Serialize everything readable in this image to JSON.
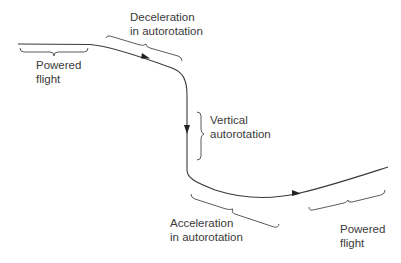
{
  "diagram": {
    "type": "flight-path",
    "colors": {
      "line": "#3a3a3a",
      "text": "#3a3a3a",
      "background": "#ffffff"
    },
    "labels": {
      "powered_flight_start": {
        "line1": "Powered",
        "line2": "flight"
      },
      "deceleration": {
        "line1": "Deceleration",
        "line2": "in autorotation"
      },
      "vertical": {
        "line1": "Vertical",
        "line2": "autorotation"
      },
      "acceleration": {
        "line1": "Acceleration",
        "line2": "in autorotation"
      },
      "powered_flight_end": {
        "line1": "Powered",
        "line2": "flight"
      }
    },
    "arrows": [
      "direction-arrow-deceleration",
      "direction-arrow-vertical",
      "direction-arrow-acceleration"
    ]
  }
}
